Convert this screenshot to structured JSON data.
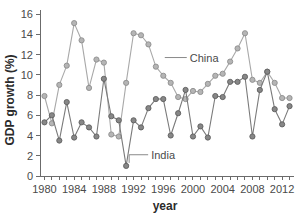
{
  "chart_data": {
    "type": "line",
    "title": "",
    "subtitle": "",
    "xlabel": "year",
    "ylabel": "GDP growth (%)",
    "xlim": [
      1979.4,
      2013.6
    ],
    "ylim": [
      0,
      16
    ],
    "ytick_step": 2,
    "yticks": [
      0,
      2,
      4,
      6,
      8,
      10,
      12,
      14,
      16
    ],
    "ytick_labels": [
      "0",
      "2",
      "4",
      "6",
      "8",
      "10",
      "12",
      "14",
      "16"
    ],
    "xticks": [
      1980,
      1981,
      1982,
      1983,
      1984,
      1985,
      1986,
      1987,
      1988,
      1989,
      1990,
      1991,
      1992,
      1993,
      1994,
      1995,
      1996,
      1997,
      1998,
      1999,
      2000,
      2001,
      2002,
      2003,
      2004,
      2005,
      2006,
      2007,
      2008,
      2009,
      2010,
      2011,
      2012,
      2013
    ],
    "xtick_labels_shown": [
      "1980",
      "1984",
      "1988",
      "1992",
      "1996",
      "2000",
      "2004",
      "2008",
      "2012"
    ],
    "xtick_labels_years": [
      1980,
      1984,
      1988,
      1992,
      1996,
      2000,
      2004,
      2008,
      2012
    ],
    "grid": false,
    "legend_position": "inline-annotation",
    "marker": "circle",
    "x": [
      1980,
      1981,
      1982,
      1983,
      1984,
      1985,
      1986,
      1987,
      1988,
      1989,
      1990,
      1991,
      1992,
      1993,
      1994,
      1995,
      1996,
      1997,
      1998,
      1999,
      2000,
      2001,
      2002,
      2003,
      2004,
      2005,
      2006,
      2007,
      2008,
      2009,
      2010,
      2011,
      2012,
      2013
    ],
    "series": [
      {
        "name": "China",
        "color": "#a8a8a8",
        "marker_fill": "#b5b5b5",
        "marker_edge": "#8d8d8d",
        "values": [
          7.9,
          5.2,
          9.0,
          10.9,
          15.1,
          13.4,
          8.7,
          11.5,
          11.2,
          4.1,
          3.9,
          9.2,
          14.1,
          13.9,
          13.0,
          10.8,
          9.9,
          9.2,
          7.8,
          7.6,
          8.4,
          8.3,
          9.1,
          9.9,
          10.1,
          11.3,
          12.6,
          14.1,
          9.5,
          9.2,
          10.3,
          9.2,
          7.7,
          7.7
        ],
        "annotation": {
          "text": "China",
          "x_year": 1996.2,
          "y_value": 11.7
        }
      },
      {
        "name": "India",
        "color": "#7a7a7a",
        "marker_fill": "#878787",
        "marker_edge": "#5f5f5f",
        "values": [
          5.3,
          6.0,
          3.5,
          7.3,
          3.8,
          5.3,
          4.8,
          3.9,
          9.6,
          5.9,
          5.5,
          1.0,
          5.5,
          4.8,
          6.7,
          7.6,
          7.6,
          4.0,
          6.2,
          8.5,
          3.9,
          4.9,
          3.8,
          7.9,
          7.8,
          9.3,
          9.3,
          9.8,
          3.9,
          8.5,
          10.3,
          6.6,
          5.1,
          6.9
        ],
        "annotation": {
          "text": "India",
          "x_year": 1993.6,
          "y_value": 2.1
        }
      }
    ]
  },
  "figure": {
    "background_color": "#ffffff",
    "axis_color": "#6b6b6b"
  }
}
